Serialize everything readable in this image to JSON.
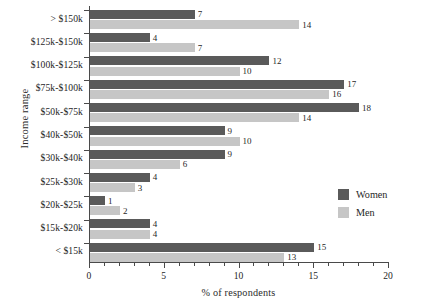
{
  "chart_data": {
    "type": "bar",
    "orientation": "horizontal",
    "title": "",
    "xlabel": "% of respondents",
    "ylabel": "Income range",
    "xlim": [
      0,
      20
    ],
    "xticks": [
      0,
      5,
      10,
      15,
      20
    ],
    "xtick_labels": [
      "0",
      "5",
      "10",
      "15",
      "20"
    ],
    "xminor_step": 1,
    "grid": false,
    "legend_position": "center-right-inside",
    "categories": [
      "> $150k",
      "$125k-$150k",
      "$100k-$125k",
      "$75k-$100k",
      "$50k-$75k",
      "$40k-$50k",
      "$30k-$40k",
      "$25k-$30k",
      "$20k-$25k",
      "$15k-$20k",
      "< $15k"
    ],
    "series": [
      {
        "name": "Women",
        "color": "#5a5a5a",
        "values": [
          7,
          4,
          12,
          17,
          18,
          9,
          9,
          4,
          1,
          4,
          15
        ]
      },
      {
        "name": "Men",
        "color": "#c6c6c6",
        "values": [
          14,
          7,
          10,
          16,
          14,
          10,
          6,
          3,
          2,
          4,
          13
        ]
      }
    ],
    "legend": [
      "Women",
      "Men"
    ],
    "clipped_header_text": ""
  }
}
